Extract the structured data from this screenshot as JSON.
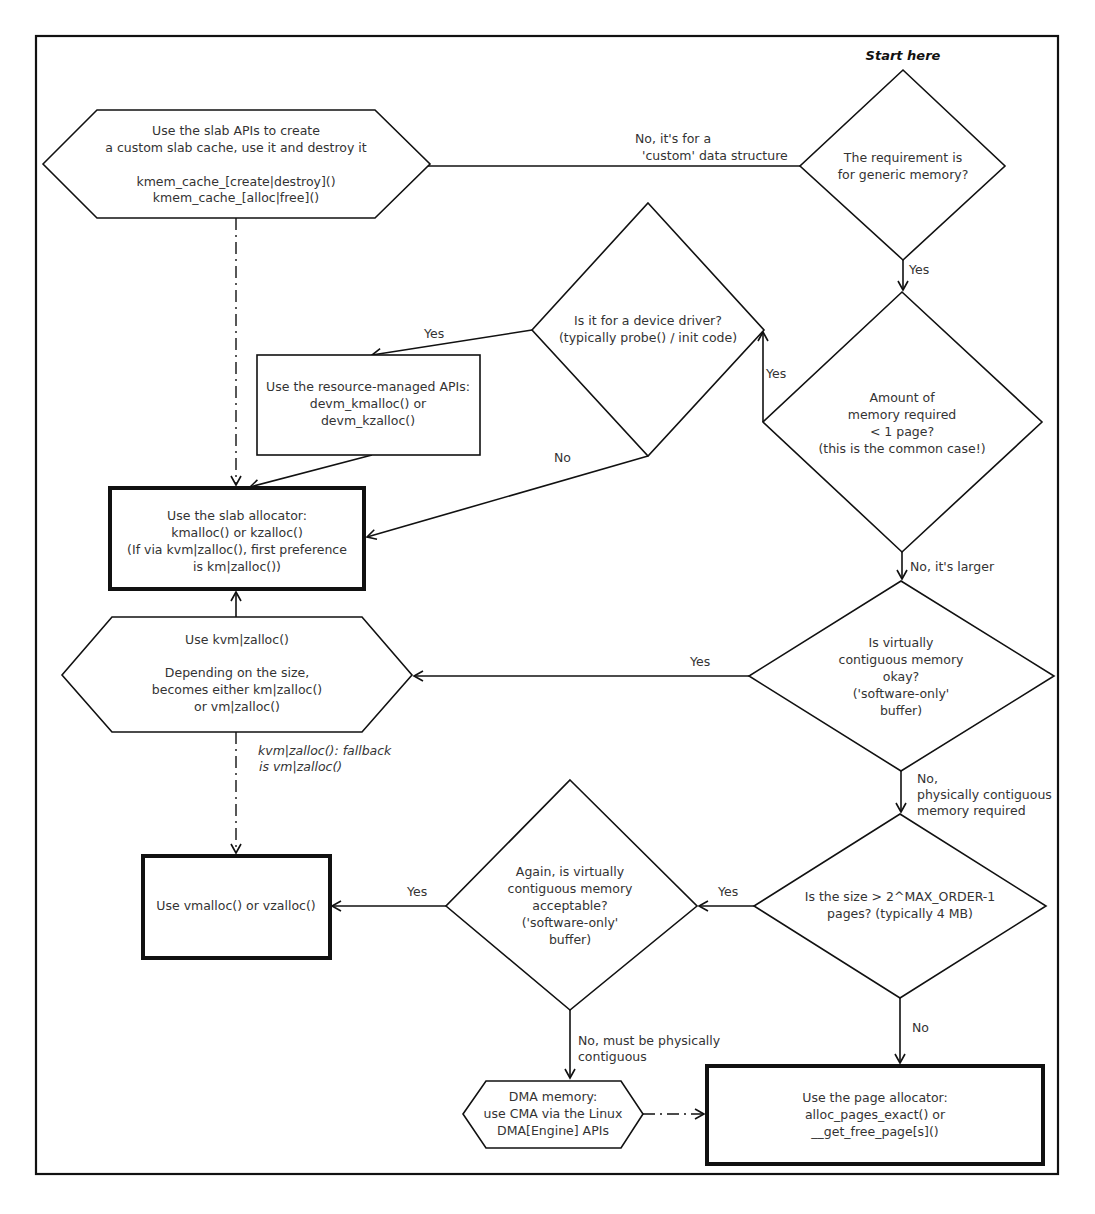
{
  "title": "Start here",
  "nodes": {
    "start_decision": {
      "lines": [
        "The requirement is",
        "for generic memory?"
      ]
    },
    "slab_cache": {
      "lines": [
        "Use the slab APIs to create",
        "a custom slab cache, use it and destroy it",
        "",
        "kmem_cache_[create|destroy]()",
        "kmem_cache_[alloc|free]()"
      ]
    },
    "device_driver_decision": {
      "lines": [
        "Is it for a device driver?",
        "(typically probe() / init code)"
      ]
    },
    "resource_managed": {
      "lines": [
        "Use the resource-managed APIs:",
        "devm_kmalloc() or",
        "devm_kzalloc()"
      ]
    },
    "amount_decision": {
      "lines": [
        "Amount of",
        "memory required",
        "< 1 page?",
        "(this is the common case!)"
      ]
    },
    "slab_allocator": {
      "lines": [
        "Use the slab allocator:",
        "kmalloc() or kzalloc()",
        "(If via kvm|zalloc(), first preference",
        "is km|zalloc())"
      ]
    },
    "kvm_zalloc": {
      "lines": [
        "Use kvm|zalloc()",
        "",
        "Depending on the size,",
        "becomes either km|zalloc()",
        "or vm|zalloc()"
      ]
    },
    "virtually_contiguous_decision": {
      "lines": [
        "Is virtually",
        "contiguous memory",
        "okay?",
        "('software-only'",
        "buffer)"
      ]
    },
    "size_decision": {
      "lines": [
        "Is the size > 2^MAX_ORDER-1",
        "pages? (typically 4 MB)"
      ]
    },
    "again_decision": {
      "lines": [
        "Again, is virtually",
        "contiguous memory",
        "acceptable?",
        "('software-only'",
        "buffer)"
      ]
    },
    "vmalloc": {
      "lines": [
        "Use vmalloc() or vzalloc()"
      ]
    },
    "dma_memory": {
      "lines": [
        "DMA memory:",
        "use CMA via the Linux",
        "DMA[Engine] APIs"
      ]
    },
    "page_allocator": {
      "lines": [
        "Use the page allocator:",
        "alloc_pages_exact() or",
        "__get_free_page[s]()"
      ]
    }
  },
  "edge_labels": {
    "custom_no": [
      "No, it's for a",
      "'custom' data structure"
    ],
    "generic_yes": "Yes",
    "driver_yes": "Yes",
    "driver_no": "No",
    "amount_yes": "Yes",
    "amount_no": "No, it's larger",
    "virtual_yes": "Yes",
    "virtual_no": [
      "No,",
      "physically contiguous",
      "memory required"
    ],
    "kvm_fallback": [
      "kvm|zalloc(): fallback",
      " is vm|zalloc()"
    ],
    "size_yes": "Yes",
    "size_no": "No",
    "again_yes": "Yes",
    "again_no": [
      "No, must be physically",
      "contiguous"
    ]
  }
}
